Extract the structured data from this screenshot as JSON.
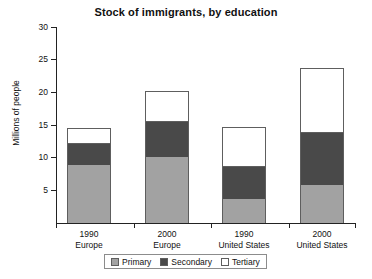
{
  "chart_data": {
    "type": "bar",
    "subtype": "stacked-vertical",
    "title": "Stock of immigrants, by education",
    "xlabel": "",
    "ylabel": "Millions of people",
    "ylim": [
      0,
      30
    ],
    "yticks": [
      5,
      10,
      15,
      20,
      25,
      30
    ],
    "ytick_labels": [
      "5",
      "10",
      "15",
      "20",
      "25",
      "30"
    ],
    "grid": false,
    "legend_position": "bottom",
    "categories": [
      {
        "year": "1990",
        "region": "Europe"
      },
      {
        "year": "2000",
        "region": "Europe"
      },
      {
        "year": "1990",
        "region": "United States"
      },
      {
        "year": "2000",
        "region": "United States"
      }
    ],
    "category_labels": [
      "1990 Europe",
      "2000 Europe",
      "1990 United States",
      "2000 United States"
    ],
    "series": [
      {
        "name": "Primary",
        "color": "#a2a2a2",
        "values": [
          8.9,
          10.1,
          3.7,
          5.8
        ]
      },
      {
        "name": "Secondary",
        "color": "#494949",
        "values": [
          3.2,
          5.4,
          4.9,
          8.0
        ]
      },
      {
        "name": "Tertiary",
        "color": "#ffffff",
        "values": [
          2.4,
          4.7,
          6.1,
          10.0
        ]
      }
    ],
    "totals": [
      14.5,
      20.2,
      14.7,
      23.8
    ]
  },
  "legend": {
    "items": [
      {
        "label": "Primary",
        "color": "#a2a2a2"
      },
      {
        "label": "Secondary",
        "color": "#494949"
      },
      {
        "label": "Tertiary",
        "color": "#ffffff"
      }
    ]
  },
  "axis": {
    "y_title": "Millions of people",
    "y_ticks": [
      "30",
      "25",
      "20",
      "15",
      "10",
      "5"
    ]
  },
  "caption_sliver": ""
}
